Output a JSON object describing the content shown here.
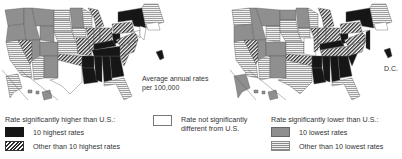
{
  "caption": {
    "line1": "Average annual rates",
    "line2": "per 100,000"
  },
  "dc_label": "D.C.",
  "maps": [
    {
      "id": "left",
      "theme": "higher-rates map"
    },
    {
      "id": "right",
      "theme": "lower-rates map"
    }
  ],
  "legend": {
    "higher": {
      "heading": "Rate significantly higher than U.S.:",
      "items": [
        {
          "label": "10 highest rates",
          "pattern": "solid-black",
          "color": "#161616"
        },
        {
          "label": "Other than 10 highest rates",
          "pattern": "diagonal-hatch",
          "color": "#2a2a2a"
        }
      ]
    },
    "not_different": {
      "line1": "Rate not significantly",
      "line2": "different from U.S.",
      "pattern": "white",
      "color": "#ffffff"
    },
    "lower": {
      "heading": "Rate significantly lower than U.S.:",
      "items": [
        {
          "label": "10 lowest rates",
          "pattern": "solid-gray",
          "color": "#8f8f8f"
        },
        {
          "label": "Other than 10 lowest rates",
          "pattern": "horizontal-lines",
          "color": "#888888"
        }
      ]
    }
  }
}
